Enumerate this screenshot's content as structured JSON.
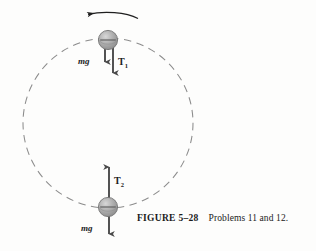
{
  "figure": {
    "kind": "physics-free-body-diagram",
    "caption": {
      "figure_number": "FIGURE 5–28",
      "text": "Problems 11 and 12."
    },
    "rotation": {
      "direction_label": "counterclockwise",
      "arrow_icon": "curved-arrow-left"
    },
    "path": {
      "shape": "circle",
      "style": "dashed",
      "color": "#8a8a8a",
      "center_x": 108,
      "center_y": 123,
      "radius": 85
    },
    "bodies": [
      {
        "position": "top",
        "icon": "ball-sphere",
        "center_x": 108,
        "center_y": 40,
        "radius": 10,
        "color": "#a9a9a9",
        "forces": [
          {
            "label": "mg",
            "direction": "down",
            "length": 26,
            "style": "italic-bold"
          },
          {
            "label": "T",
            "subscript": "1",
            "direction": "down",
            "length": 37,
            "style": "upright-bold"
          }
        ]
      },
      {
        "position": "bottom",
        "icon": "ball-sphere",
        "center_x": 108,
        "center_y": 207,
        "radius": 10,
        "color": "#a9a9a9",
        "forces": [
          {
            "label": "T",
            "subscript": "2",
            "direction": "up",
            "length": 45,
            "style": "upright-bold"
          },
          {
            "label": "mg",
            "direction": "down",
            "length": 31,
            "style": "italic-bold"
          }
        ]
      }
    ],
    "colors": {
      "ink": "#1b1b1b",
      "dashed_path": "#8a8a8a",
      "ball_fill": "#a9a9a9",
      "ball_edge": "#6f6f6f",
      "arrow": "#4a4a4a",
      "background": "#fdfdfc"
    },
    "ghost_marks": {
      "left": "",
      "right": ""
    }
  }
}
